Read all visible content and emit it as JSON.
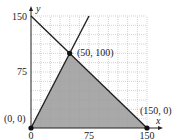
{
  "chart_data": {
    "type": "line",
    "title": "",
    "xlabel": "x",
    "ylabel": "y",
    "xlim": [
      0,
      150
    ],
    "ylim": [
      0,
      150
    ],
    "grid": true,
    "grid_step": 12.5,
    "x_ticks": [
      0,
      75,
      150
    ],
    "y_ticks": [
      75,
      150
    ],
    "x_tick_labels": [
      "0",
      "75",
      "150"
    ],
    "y_tick_labels": [
      "75",
      "150"
    ],
    "series": [
      {
        "name": "x + y = 150",
        "x": [
          0,
          150
        ],
        "y": [
          150,
          0
        ]
      },
      {
        "name": "y = 2x",
        "x": [
          0,
          75
        ],
        "y": [
          0,
          150
        ]
      }
    ],
    "shaded_region": {
      "description": "feasible region",
      "vertices": [
        [
          0,
          0
        ],
        [
          50,
          100
        ],
        [
          150,
          0
        ]
      ],
      "fill": "#9a9a9a"
    },
    "points": [
      {
        "x": 0,
        "y": 0,
        "label": "(0, 0)"
      },
      {
        "x": 50,
        "y": 100,
        "label": "(50, 100)"
      },
      {
        "x": 150,
        "y": 0,
        "label": "(150, 0)"
      }
    ],
    "legend": null
  },
  "labels": {
    "origin": "(0, 0)",
    "intersection": "(50, 100)",
    "x_intercept": "(150, 0)",
    "x_axis": "x",
    "y_axis": "y",
    "tick_x0": "0",
    "tick_x75": "75",
    "tick_x150": "150",
    "tick_y75": "75",
    "tick_y150": "150"
  }
}
